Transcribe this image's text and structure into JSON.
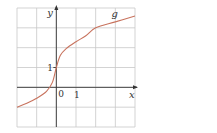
{
  "chart_data": {
    "type": "line",
    "title": "",
    "xlabel": "x",
    "ylabel": "y",
    "xlim": [
      -2,
      4
    ],
    "ylim": [
      -2,
      4
    ],
    "grid": true,
    "grid_step": 1,
    "tick_labels": {
      "origin": "0",
      "x_one": "1",
      "y_one": "1"
    },
    "series": [
      {
        "name": "g",
        "color": "#c8735e",
        "x": [
          -2,
          -1.5,
          -1,
          -0.5,
          -0.2,
          0,
          0.2,
          0.5,
          1,
          1.5,
          2,
          3,
          4
        ],
        "y": [
          -1.0,
          -0.8,
          -0.55,
          -0.2,
          0.25,
          1.0,
          1.6,
          1.95,
          2.3,
          2.6,
          3.0,
          3.3,
          3.6
        ]
      }
    ],
    "curve_label": "g"
  },
  "colors": {
    "grid": "#c8c8c8",
    "axis": "#333333",
    "curve": "#c8735e"
  }
}
